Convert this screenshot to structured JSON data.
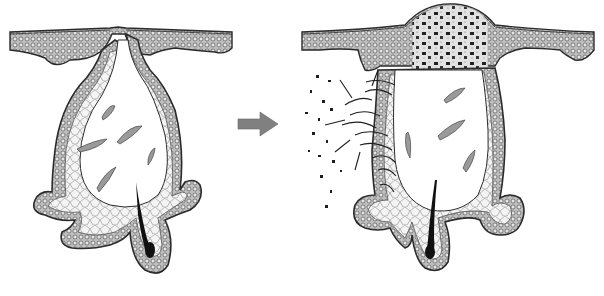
{
  "figure": {
    "panels": [
      {
        "id": "before",
        "label": "normal-follicle"
      },
      {
        "id": "after",
        "label": "ruptured-inflamed-follicle"
      }
    ],
    "arrow": {
      "direction": "right"
    },
    "colors": {
      "outline": "#2b2b2b",
      "tissue": "#9a9a9a",
      "cell_fill": "#d8d8d8",
      "debris": "#8c8c8c",
      "hair": "#111111",
      "arrow": "#808080",
      "background": "#ffffff"
    }
  }
}
